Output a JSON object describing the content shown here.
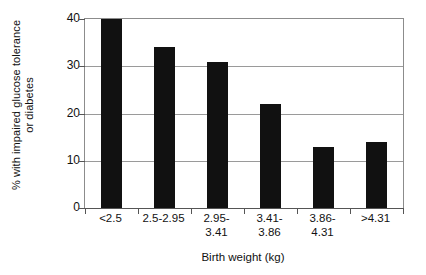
{
  "chart_data": {
    "type": "bar",
    "title": "",
    "xlabel": "Birth weight (kg)",
    "ylabel_line1": "% with impaired glucose tolerance",
    "ylabel_line2": "or diabetes",
    "categories": [
      "<2.5",
      "2.5-2.95",
      "2.95-\n3.41",
      "3.41-\n3.86",
      "3.86-\n4.31",
      ">4.31"
    ],
    "category_lines": [
      {
        "l1": "<2.5",
        "l2": ""
      },
      {
        "l1": "2.5-2.95",
        "l2": ""
      },
      {
        "l1": "2.95-",
        "l2": "3.41"
      },
      {
        "l1": "3.41-",
        "l2": "3.86"
      },
      {
        "l1": "3.86-",
        "l2": "4.31"
      },
      {
        "l1": ">4.31",
        "l2": ""
      }
    ],
    "values": [
      40,
      34,
      31,
      22,
      13,
      14
    ],
    "ylim": [
      0,
      40
    ],
    "yticks": [
      0,
      10,
      20,
      30,
      40
    ],
    "ytick_labels": [
      "0",
      "10",
      "20",
      "30",
      "40"
    ],
    "grid": "horizontal",
    "legend": "none",
    "bar_color": "#111111",
    "grid_color": "#9a9a9a",
    "axis_color": "#555555"
  }
}
